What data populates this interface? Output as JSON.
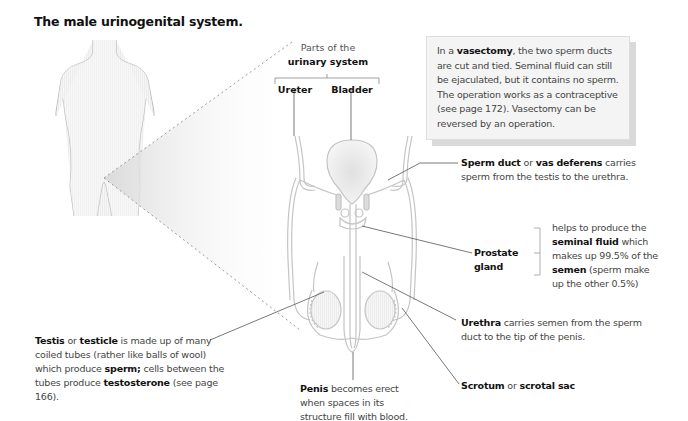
{
  "title": "The male urinogenital system.",
  "urinary_header": {
    "line1": "Parts of the",
    "line2": "urinary system",
    "items": [
      "Ureter",
      "Bladder"
    ]
  },
  "info_box": {
    "pre": "In a ",
    "bold": "vasectomy",
    "post": ", the two sperm ducts are cut and tied. Seminal fluid can still be ejaculated, but it contains no sperm. The operation works as a contraceptive (see page 172). Vasectomy can be reversed by an operation."
  },
  "labels": {
    "sperm_duct": {
      "b1": "Sperm duct",
      "t1": " or ",
      "b2": "vas deferens",
      "t2": " carries sperm from the testis to the urethra."
    },
    "prostate": {
      "name": "Prostate gland",
      "desc_t1": "helps to produce the ",
      "desc_b1": "seminal fluid",
      "desc_t2": " which makes up 99.5% of the ",
      "desc_b2": "semen",
      "desc_t3": " (sperm make up the other 0.5%)"
    },
    "urethra": {
      "b1": "Urethra",
      "t1": " carries semen from the sperm duct to the tip of the penis."
    },
    "scrotum": {
      "b1": "Scrotum",
      "t1": " or ",
      "b2": "scrotal sac"
    },
    "penis": {
      "b1": "Penis",
      "t1": " becomes erect when spaces in its structure fill with blood."
    },
    "testis": {
      "b1": "Testis",
      "t1": " or ",
      "b2": "testicle",
      "t2": " is made up of many coiled tubes (rather like balls of wool) which produce ",
      "b3": "sperm;",
      "t3": " cells between the tubes produce ",
      "b4": "testosterone",
      "t4": " (see page 166)."
    }
  },
  "colors": {
    "outline": "#bbbbbb",
    "leader": "#555555",
    "dotted": "#9a9a9a",
    "fill": "#eeeeee"
  }
}
